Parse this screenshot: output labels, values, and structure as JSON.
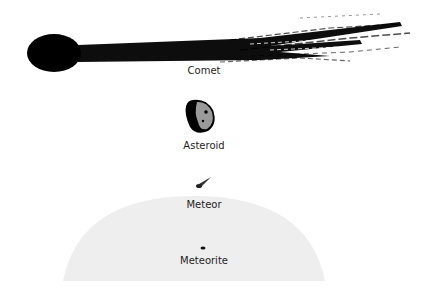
{
  "diagram": {
    "labels": {
      "comet": "Comet",
      "asteroid": "Asteroid",
      "meteor": "Meteor",
      "meteorite": "Meteorite"
    },
    "colors": {
      "object": "#000000",
      "asteroid_surface": "#9a9a9a",
      "atmosphere": "#eeeeee",
      "text": "#1e1e1e"
    }
  }
}
